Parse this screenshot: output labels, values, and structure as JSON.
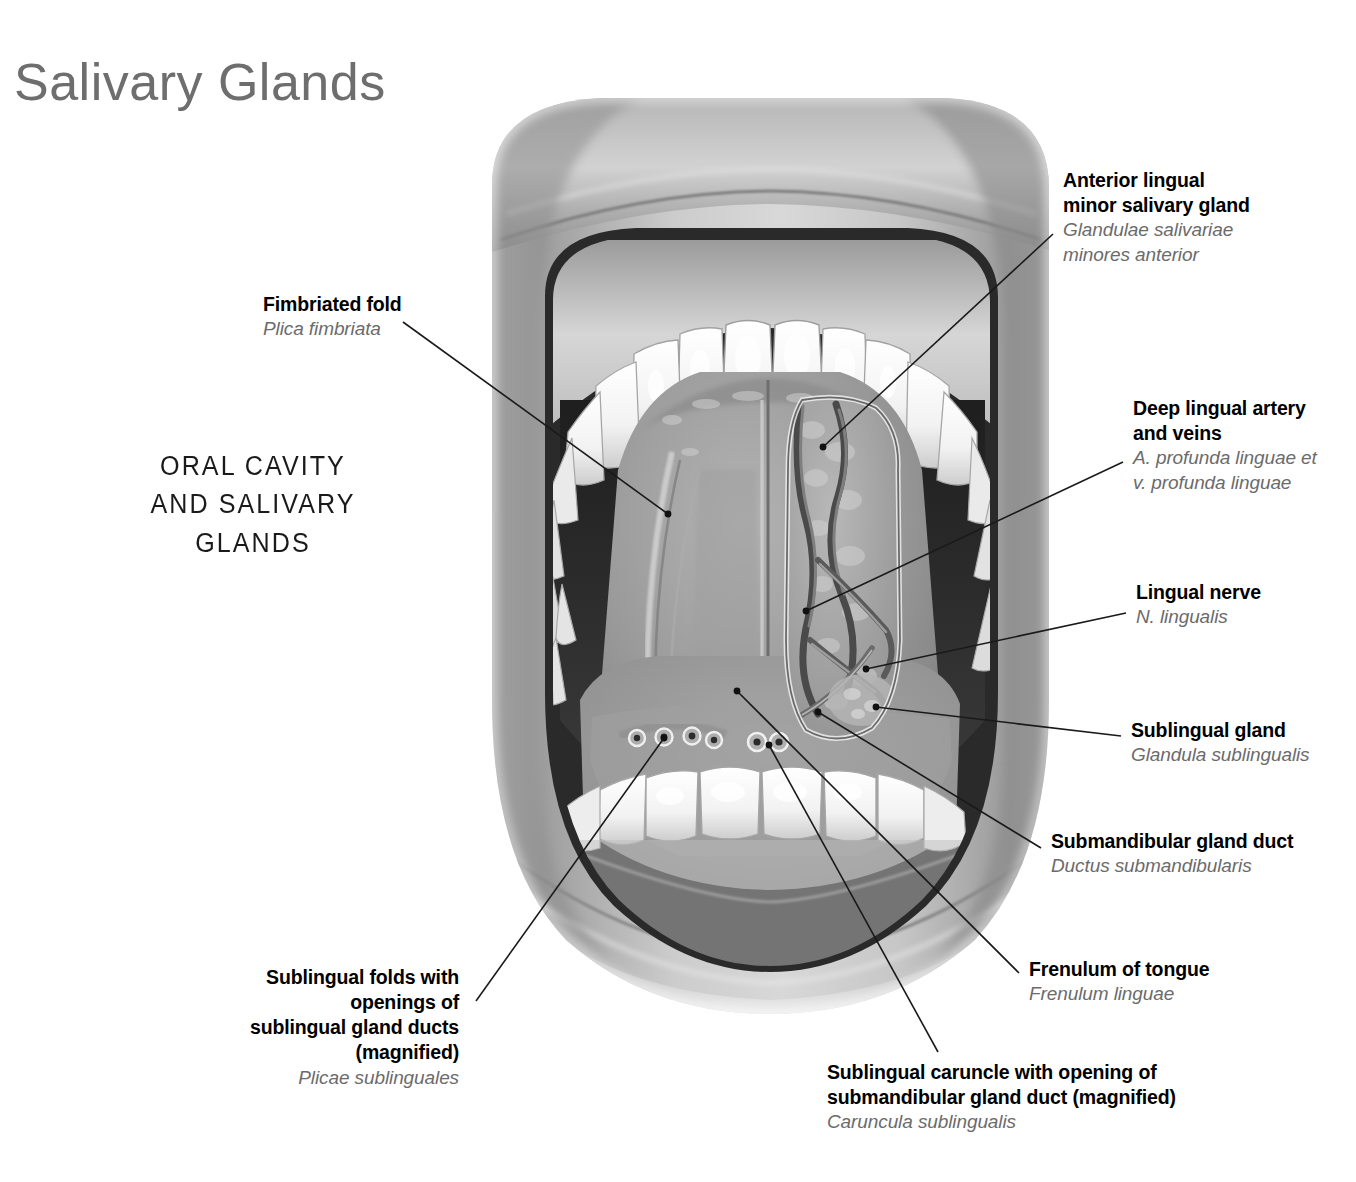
{
  "page": {
    "title": "Salivary Glands",
    "section_title": "ORAL CAVITY AND\nSALIVARY GLANDS",
    "background_color": "#ffffff",
    "title_color": "#6e6e6e",
    "label_color": "#000000",
    "latin_color": "#6b6b6b",
    "leader_color": "#1a1a1a"
  },
  "illustration": {
    "name": "open-mouth-oral-cavity-anatomical-illustration",
    "description": "Grayscale anatomical illustration of an open mouth viewed from the front, tongue raised to show the floor of the mouth, upper and lower dental arches, and the dissected right sublingual region with vessels and gland",
    "style": "grayscale airbrush/medical illustration"
  },
  "labels": [
    {
      "id": "fimbriated-fold",
      "en": "Fimbriated fold",
      "la": "Plica fimbriata",
      "align": "left",
      "x": 263,
      "y": 292
    },
    {
      "id": "anterior-lingual-minor-salivary-gland",
      "en": "Anterior lingual\nminor salivary gland",
      "la": "Glandulae salivariae\nminores anterior",
      "align": "left",
      "x": 1063,
      "y": 168
    },
    {
      "id": "deep-lingual-artery-and-veins",
      "en": "Deep lingual artery\nand veins",
      "la": "A. profunda linguae et\nv. profunda linguae",
      "align": "left",
      "x": 1133,
      "y": 396
    },
    {
      "id": "lingual-nerve",
      "en": "Lingual nerve",
      "la": "N. lingualis",
      "align": "left",
      "x": 1136,
      "y": 580
    },
    {
      "id": "sublingual-gland",
      "en": "Sublingual gland",
      "la": "Glandula sublingualis",
      "align": "left",
      "x": 1131,
      "y": 718
    },
    {
      "id": "submandibular-gland-duct",
      "en": "Submandibular gland duct",
      "la": "Ductus submandibularis",
      "align": "left",
      "x": 1051,
      "y": 829
    },
    {
      "id": "frenulum-of-tongue",
      "en": "Frenulum of tongue",
      "la": "Frenulum linguae",
      "align": "left",
      "x": 1029,
      "y": 957
    },
    {
      "id": "sublingual-folds-with-openings",
      "en": "Sublingual folds with openings of\nsublingual gland ducts (magnified)",
      "la": "Plicae sublinguales",
      "align": "right",
      "x": 183,
      "y": 965,
      "width": 276
    },
    {
      "id": "sublingual-caruncle-with-opening",
      "en": "Sublingual caruncle with opening of\nsubmandibular gland duct (magnified)",
      "la": "Caruncula sublingualis",
      "align": "left",
      "x": 827,
      "y": 1060
    }
  ],
  "leaders": [
    {
      "id": "leader-fimbriated-fold",
      "points": "403,322 668,514",
      "dot": "668,514"
    },
    {
      "id": "leader-anterior-lingual-gland",
      "points": "1053,234 823,447",
      "dot": "823,447"
    },
    {
      "id": "leader-deep-lingual-artery",
      "points": "1123,462 806,611",
      "dot": "806,611"
    },
    {
      "id": "leader-lingual-nerve",
      "points": "1126,613 866,669",
      "dot": "866,669"
    },
    {
      "id": "leader-sublingual-gland",
      "points": "1121,736 876,707",
      "dot": "876,707"
    },
    {
      "id": "leader-submandibular-gland-duct",
      "points": "1041,848 818,712",
      "dot": "818,712"
    },
    {
      "id": "leader-frenulum-of-tongue",
      "points": "1019,973 737,691",
      "dot": "737,691"
    },
    {
      "id": "leader-sublingual-folds",
      "points": "476,1001 664,738",
      "dot": "664,738"
    },
    {
      "id": "leader-sublingual-caruncle",
      "points": "938,1052 769,745",
      "dot": "769,745"
    }
  ]
}
